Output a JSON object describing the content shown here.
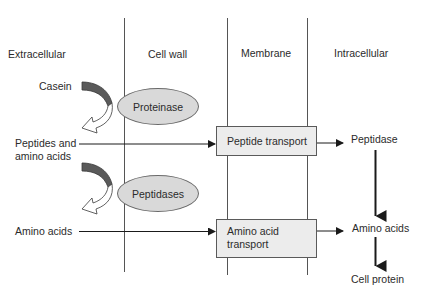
{
  "columns": [
    {
      "id": "extracellular",
      "label": "Extracellular"
    },
    {
      "id": "cell_wall",
      "label": "Cell wall"
    },
    {
      "id": "membrane",
      "label": "Membrane"
    },
    {
      "id": "intracellular",
      "label": "Intracellular"
    }
  ],
  "extracellular": {
    "casein": "Casein",
    "peptides_and_amino_acids_line1": "Peptides and",
    "peptides_and_amino_acids_line2": "amino acids",
    "amino_acids": "Amino acids"
  },
  "enzymes": {
    "proteinase": "Proteinase",
    "peptidases": "Peptidases"
  },
  "transporters": {
    "peptide_transport": "Peptide transport",
    "amino_acid_transport_line1": "Amino acid",
    "amino_acid_transport_line2": "transport"
  },
  "intracellular": {
    "peptidase": "Peptidase",
    "amino_acids": "Amino acids",
    "cell_protein": "Cell protein"
  },
  "colors": {
    "line": "#555555",
    "arrow": "#1a1a1a",
    "curved_arrow_fill": "#5a5a5a",
    "ellipse_fill": "#d9d9d9",
    "box_fill": "#ececec"
  }
}
